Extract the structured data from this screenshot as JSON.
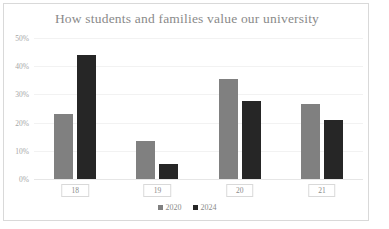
{
  "chart_data": {
    "type": "bar",
    "title": "How students and families value our university",
    "xlabel": "",
    "ylabel": "",
    "categories": [
      "18",
      "19",
      "20",
      "21"
    ],
    "series": [
      {
        "name": "2020",
        "color": "#808080",
        "values": [
          23,
          13.5,
          35.5,
          26.5
        ]
      },
      {
        "name": "2024",
        "color": "#262626",
        "values": [
          44,
          5.5,
          27.5,
          21
        ]
      }
    ],
    "ylim": [
      0,
      50
    ],
    "yticks": [
      0,
      10,
      20,
      30,
      40,
      50
    ],
    "ytick_labels": [
      "0%",
      "10%",
      "20%",
      "30%",
      "40%",
      "50%"
    ],
    "grid": true,
    "legend_position": "bottom",
    "legend": [
      "2020",
      "2024"
    ],
    "value_format": "percent",
    "title_color": "#8a8a8a",
    "axis_text_color": "#a6a6a6",
    "gridline_color": "#f2f2f2",
    "border_color": "#d9d9d9",
    "background": "#ffffff"
  }
}
